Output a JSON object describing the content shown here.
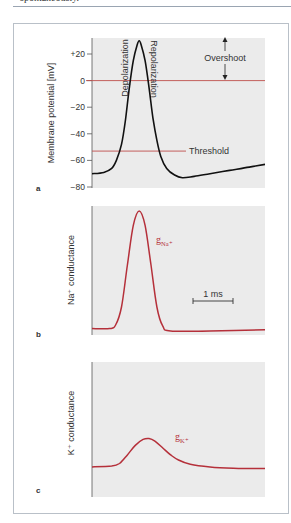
{
  "page": {
    "top_text": "spontaneously."
  },
  "chart_data": [
    {
      "type": "line",
      "panel_label": "a",
      "ylabel": "Membrane potential [mV]",
      "xlabel": "",
      "ylim": [
        -80,
        30
      ],
      "yticks": [
        {
          "value": 20,
          "label": "+20"
        },
        {
          "value": 0,
          "label": "0"
        },
        {
          "value": -20,
          "label": "−20"
        },
        {
          "value": -40,
          "label": "−40"
        },
        {
          "value": -60,
          "label": "−60"
        },
        {
          "value": -80,
          "label": "−80"
        }
      ],
      "xlim": [
        0,
        4.4
      ],
      "series": [
        {
          "name": "Action potential",
          "color": "#111111",
          "points": [
            [
              0,
              -70
            ],
            [
              0.3,
              -69
            ],
            [
              0.5,
              -66
            ],
            [
              0.62,
              -60
            ],
            [
              0.75,
              -48
            ],
            [
              0.85,
              -30
            ],
            [
              0.95,
              -5
            ],
            [
              1.05,
              15
            ],
            [
              1.15,
              27
            ],
            [
              1.2,
              30
            ],
            [
              1.25,
              27
            ],
            [
              1.35,
              15
            ],
            [
              1.45,
              -5
            ],
            [
              1.55,
              -28
            ],
            [
              1.65,
              -45
            ],
            [
              1.75,
              -57
            ],
            [
              1.9,
              -66
            ],
            [
              2.1,
              -71
            ],
            [
              2.3,
              -73
            ],
            [
              2.6,
              -72
            ],
            [
              3.0,
              -70
            ],
            [
              3.5,
              -67.5
            ],
            [
              4.0,
              -65
            ],
            [
              4.4,
              -63
            ]
          ]
        }
      ],
      "reference_lines": [
        {
          "name": "zero",
          "value": 0,
          "color": "#c0504d"
        },
        {
          "name": "Threshold",
          "value": -53,
          "color": "#c0504d",
          "label": "Threshold"
        }
      ],
      "annotations": {
        "depolarization": "Depolarization",
        "repolarization": "Repolarization",
        "overshoot": "Overshoot"
      }
    },
    {
      "type": "line",
      "panel_label": "b",
      "ylabel": "Na⁺ conductance",
      "xlim": [
        0,
        4.4
      ],
      "ylim": [
        0,
        1.05
      ],
      "series": [
        {
          "name": "gNa+",
          "label_main": "g",
          "label_sub": "Na⁺",
          "color": "#b5303a",
          "points": [
            [
              0,
              0.02
            ],
            [
              0.45,
              0.02
            ],
            [
              0.6,
              0.05
            ],
            [
              0.75,
              0.2
            ],
            [
              0.9,
              0.55
            ],
            [
              1.05,
              0.88
            ],
            [
              1.2,
              1.0
            ],
            [
              1.35,
              0.88
            ],
            [
              1.5,
              0.55
            ],
            [
              1.65,
              0.2
            ],
            [
              1.8,
              0.04
            ],
            [
              2.0,
              0.0
            ],
            [
              3.0,
              0.0
            ],
            [
              4.4,
              0.01
            ]
          ]
        }
      ],
      "scale_bar": {
        "label": "1 ms",
        "duration_ms": 1
      }
    },
    {
      "type": "line",
      "panel_label": "c",
      "ylabel": "K⁺ conductance",
      "xlim": [
        0,
        4.4
      ],
      "ylim": [
        0,
        1.05
      ],
      "series": [
        {
          "name": "gK+",
          "label_main": "g",
          "label_sub": "K⁺",
          "color": "#b5303a",
          "points": [
            [
              0,
              0.28
            ],
            [
              0.5,
              0.29
            ],
            [
              0.7,
              0.32
            ],
            [
              0.9,
              0.42
            ],
            [
              1.1,
              0.53
            ],
            [
              1.3,
              0.6
            ],
            [
              1.45,
              0.61
            ],
            [
              1.6,
              0.58
            ],
            [
              1.8,
              0.5
            ],
            [
              2.0,
              0.42
            ],
            [
              2.2,
              0.36
            ],
            [
              2.5,
              0.31
            ],
            [
              3.0,
              0.28
            ],
            [
              3.6,
              0.265
            ],
            [
              4.4,
              0.26
            ]
          ]
        }
      ]
    }
  ]
}
